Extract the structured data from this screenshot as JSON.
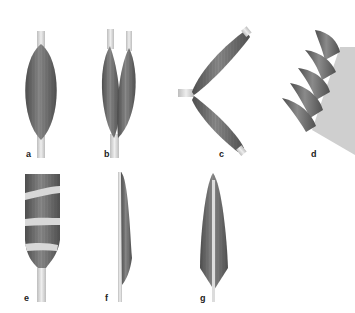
{
  "figure": {
    "panels": [
      {
        "id": "a",
        "label": "a",
        "description": "fusiform muscle"
      },
      {
        "id": "b",
        "label": "b",
        "description": "two-headed muscle"
      },
      {
        "id": "c",
        "label": "c",
        "description": "two-bellied muscle"
      },
      {
        "id": "d",
        "label": "d",
        "description": "multi-headed serrated muscle"
      },
      {
        "id": "e",
        "label": "e",
        "description": "muscle with tendinous intersections"
      },
      {
        "id": "f",
        "label": "f",
        "description": "unipennate muscle"
      },
      {
        "id": "g",
        "label": "g",
        "description": "bipennate muscle"
      }
    ],
    "colors": {
      "muscle": "#7a7a7a",
      "muscle_dark": "#505050",
      "tendon": "#d4d4d4",
      "label": "#222222"
    }
  }
}
